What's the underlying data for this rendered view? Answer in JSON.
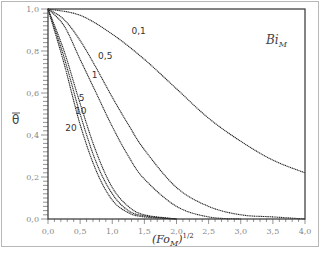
{
  "chart_data": {
    "type": "line",
    "title": "",
    "xlabel": "(Fo_M)^1/2",
    "ylabel": "θ̄",
    "xlim": [
      0.0,
      4.0
    ],
    "ylim": [
      0.0,
      1.0
    ],
    "grid": false,
    "legend_title": "Bi_M",
    "x_ticks": [
      "0,0",
      "0,5",
      "1,0",
      "1,5",
      "2,0",
      "2,5",
      "3,0",
      "3,5",
      "4,0"
    ],
    "y_ticks": [
      "0,0",
      "0,2",
      "0,4",
      "0,6",
      "0,8",
      "1,0"
    ],
    "series": [
      {
        "name": "0,1",
        "x": [
          0,
          0.5,
          1.0,
          1.5,
          2.0,
          2.5,
          3.0,
          3.5,
          4.0
        ],
        "values": [
          1.0,
          0.97,
          0.88,
          0.76,
          0.62,
          0.48,
          0.37,
          0.28,
          0.22
        ]
      },
      {
        "name": "0,5",
        "x": [
          0,
          0.25,
          0.5,
          0.75,
          1.0,
          1.25,
          1.5,
          2.0,
          2.5,
          3.0,
          3.5,
          4.0
        ],
        "values": [
          1.0,
          0.95,
          0.85,
          0.72,
          0.58,
          0.45,
          0.33,
          0.15,
          0.06,
          0.02,
          0.01,
          0.0
        ]
      },
      {
        "name": "1",
        "x": [
          0,
          0.25,
          0.5,
          0.75,
          1.0,
          1.25,
          1.5,
          2.0,
          2.5,
          3.0
        ],
        "values": [
          1.0,
          0.92,
          0.76,
          0.6,
          0.44,
          0.3,
          0.19,
          0.06,
          0.01,
          0.0
        ]
      },
      {
        "name": "5",
        "x": [
          0,
          0.25,
          0.5,
          0.75,
          1.0,
          1.25,
          1.5,
          2.0
        ],
        "values": [
          1.0,
          0.8,
          0.55,
          0.32,
          0.15,
          0.06,
          0.02,
          0.0
        ]
      },
      {
        "name": "10",
        "x": [
          0,
          0.25,
          0.5,
          0.75,
          1.0,
          1.25,
          1.5,
          2.0
        ],
        "values": [
          1.0,
          0.77,
          0.5,
          0.27,
          0.12,
          0.04,
          0.015,
          0.0
        ]
      },
      {
        "name": "20",
        "x": [
          0,
          0.25,
          0.5,
          0.75,
          1.0,
          1.25,
          1.5,
          2.0
        ],
        "values": [
          1.0,
          0.74,
          0.45,
          0.23,
          0.09,
          0.03,
          0.01,
          0.0
        ]
      }
    ],
    "curve_label_positions": [
      {
        "name": "0,1",
        "x": 1.3,
        "y": 0.88
      },
      {
        "name": "0,5",
        "x": 0.78,
        "y": 0.76
      },
      {
        "name": "1",
        "x": 0.68,
        "y": 0.67
      },
      {
        "name": "5",
        "x": 0.48,
        "y": 0.56
      },
      {
        "name": "10",
        "x": 0.42,
        "y": 0.5
      },
      {
        "name": "20",
        "x": 0.27,
        "y": 0.42
      }
    ]
  }
}
